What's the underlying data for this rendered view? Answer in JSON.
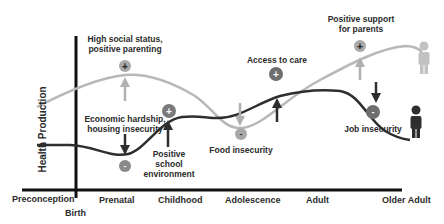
{
  "diagram": {
    "type": "life-course health production diagram",
    "y_axis_label": "Health Production",
    "x_axis": {
      "stages": [
        "Preconception",
        "Birth",
        "Prenatal",
        "Childhood",
        "Adolescence",
        "Adult",
        "Older Adult"
      ]
    },
    "series": [
      {
        "name": "advantaged-trajectory",
        "color": "#b8b8b8",
        "person_icon_color": "#c2c2c2"
      },
      {
        "name": "disadvantaged-trajectory",
        "color": "#2e2e2e",
        "person_icon_color": "#2e2e2e"
      }
    ],
    "annotations": [
      {
        "id": "high-social-status",
        "text_line1": "High social status,",
        "text_line2": "positive parenting",
        "sign": "+",
        "arrow": "up",
        "series": "advantaged-trajectory"
      },
      {
        "id": "economic-hardship",
        "text_line1": "Economic hardship,",
        "text_line2": "housing insecurity",
        "sign": "-",
        "arrow": "down",
        "series": "disadvantaged-trajectory"
      },
      {
        "id": "positive-school",
        "text_line1": "Positive",
        "text_line2": "school",
        "text_line3": "environment",
        "sign": "+",
        "arrow": "up",
        "series": "disadvantaged-trajectory"
      },
      {
        "id": "food-insecurity",
        "text_line1": "Food insecurity",
        "sign": "-",
        "arrow": "down",
        "series": "advantaged-trajectory"
      },
      {
        "id": "access-to-care",
        "text_line1": "Access to care",
        "sign": "+",
        "arrow": "up",
        "series": "disadvantaged-trajectory"
      },
      {
        "id": "positive-support",
        "text_line1": "Positive support",
        "text_line2": "for parents",
        "sign": "+",
        "arrow": "up",
        "series": "advantaged-trajectory"
      },
      {
        "id": "job-insecurity",
        "text_line1": "Job insecurity",
        "sign": "-",
        "arrow": "down",
        "series": "disadvantaged-trajectory"
      }
    ],
    "colors": {
      "axis": "#111111",
      "light_curve": "#b8b8b8",
      "dark_curve": "#2e2e2e",
      "marker_light": "#a8a8a8",
      "marker_dark": "#6e6e6e",
      "arrow_light": "#b0b0b0",
      "arrow_dark": "#2e2e2e",
      "text": "#2b2b2b"
    }
  }
}
